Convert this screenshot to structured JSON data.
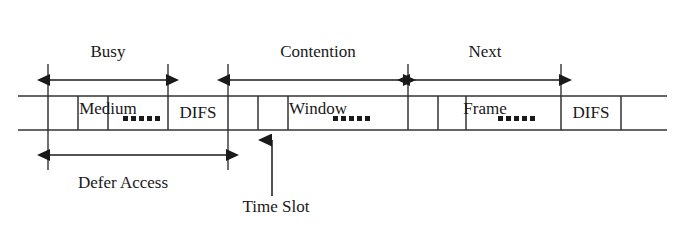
{
  "figure": {
    "type": "timing-diagram",
    "topic": "IEEE 802.11 CSMA/CA medium access timing"
  },
  "top_labels": [
    {
      "id": "busy-medium",
      "text": "Busy\nMedium",
      "line1": "Busy",
      "line2": "Medium",
      "center_x": 108,
      "y": 4
    },
    {
      "id": "contention-window",
      "text": "Contention\nWindow",
      "line1": "Contention",
      "line2": "Window",
      "center_x": 318,
      "y": 4
    },
    {
      "id": "next-frame",
      "text": "Next\nFrame",
      "line1": "Next",
      "line2": "Frame",
      "center_x": 485,
      "y": 4
    }
  ],
  "bottom_labels": [
    {
      "id": "defer-access",
      "text": "Defer Access",
      "center_x": 123,
      "y": 177
    },
    {
      "id": "time-slot",
      "text": "Time Slot",
      "center_x": 276,
      "y": 200
    }
  ],
  "cell_labels": [
    {
      "id": "difs-1",
      "text": "DIFS",
      "center_x": 198
    },
    {
      "id": "difs-2",
      "text": "DIFS",
      "center_x": 591
    }
  ],
  "timeline": {
    "x_start": 18,
    "x_end": 667,
    "top_y": 96,
    "bottom_y": 130,
    "dividers": [
      48,
      78,
      108,
      168,
      228,
      258,
      288,
      408,
      438,
      466,
      561,
      621
    ],
    "dotted_cells": [
      {
        "id": "dots-busy",
        "center_x": 138,
        "count": 5
      },
      {
        "id": "dots-contention",
        "center_x": 348,
        "count": 5
      },
      {
        "id": "dots-next-frame",
        "center_x": 513,
        "count": 5
      }
    ]
  },
  "arrows_top": [
    {
      "id": "busy-medium-arrow",
      "x1": 48,
      "x2": 168,
      "y": 80,
      "heads": "both"
    },
    {
      "id": "contention-window-arrow",
      "x1": 228,
      "x2": 405,
      "y": 80,
      "heads": "both"
    },
    {
      "id": "next-frame-arrow",
      "x1": 408,
      "x2": 561,
      "y": 80,
      "heads": "both"
    }
  ],
  "arrows_bottom": [
    {
      "id": "defer-access-arrow",
      "x1": 48,
      "x2": 228,
      "y": 155,
      "heads": "both"
    },
    {
      "id": "time-slot-arrow",
      "x": 272,
      "y1": 196,
      "y2": 138,
      "heads": "up"
    }
  ],
  "guides_top": [
    {
      "id": "guide-48",
      "x": 48,
      "y1": 64,
      "y2": 96
    },
    {
      "id": "guide-168",
      "x": 168,
      "y1": 64,
      "y2": 96
    },
    {
      "id": "guide-228",
      "x": 228,
      "y1": 64,
      "y2": 96
    },
    {
      "id": "guide-408",
      "x": 408,
      "y1": 64,
      "y2": 96
    },
    {
      "id": "guide-561",
      "x": 561,
      "y1": 64,
      "y2": 96
    }
  ],
  "guides_bottom": [
    {
      "id": "guide-b-48",
      "x": 48,
      "y1": 130,
      "y2": 170
    },
    {
      "id": "guide-b-228",
      "x": 228,
      "y1": 130,
      "y2": 170
    }
  ],
  "colors": {
    "line": "#333333",
    "text": "#181818",
    "background": "#ffffff"
  }
}
